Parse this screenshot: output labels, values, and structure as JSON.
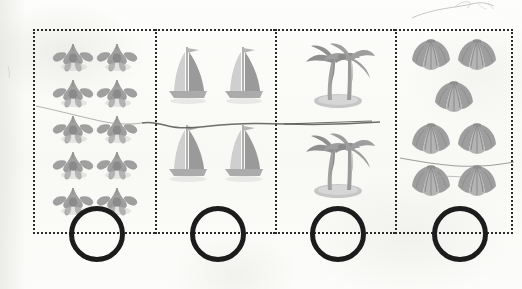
{
  "worksheet": {
    "type": "counting-worksheet",
    "title": "",
    "background_color": "#fbfbf9",
    "border_color": "#2a2a2a",
    "border_style": "dotted",
    "circle_stroke_color": "#1c1c1c",
    "icon_color": "#9a9a9a",
    "cells": [
      {
        "id": "cell-flowers",
        "icon_name": "flower-icon",
        "icon_label": "flower",
        "count": 10,
        "layout_rows": [
          2,
          2,
          2,
          2,
          2
        ],
        "answer_value": "",
        "answer_placeholder": ""
      },
      {
        "id": "cell-sailboats",
        "icon_name": "sailboat-icon",
        "icon_label": "sailboat",
        "count": 4,
        "layout_rows": [
          2,
          2
        ],
        "answer_value": "",
        "answer_placeholder": ""
      },
      {
        "id": "cell-palm-trees",
        "icon_name": "palm-tree-island-icon",
        "icon_label": "palm tree island",
        "count": 2,
        "layout_rows": [
          1,
          1
        ],
        "answer_value": "",
        "answer_placeholder": ""
      },
      {
        "id": "cell-shells",
        "icon_name": "seashell-icon",
        "icon_label": "seashell",
        "count": 7,
        "layout_rows": [
          2,
          1,
          2,
          2
        ],
        "answer_value": "",
        "answer_placeholder": ""
      }
    ],
    "annotations": [
      {
        "id": "scribble-top-right",
        "label": "faint pencil squiggle"
      },
      {
        "id": "scribble-across-row",
        "label": "faint pencil line across page"
      },
      {
        "id": "scribble-left-margin",
        "label": "faint pencil tick in left margin"
      },
      {
        "id": "scribble-shell-line",
        "label": "faint pencil line through shells"
      }
    ]
  }
}
